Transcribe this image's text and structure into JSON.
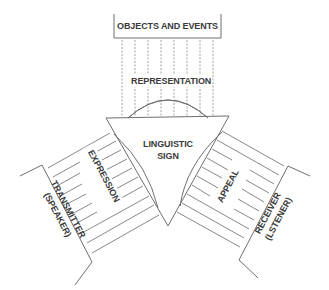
{
  "diagram": {
    "top_box": {
      "label": "OBJECTS AND EVENTS"
    },
    "top_channel": {
      "label": "REPRESENTATION"
    },
    "center": {
      "line1": "LINGUISTIC",
      "line2": "SIGN"
    },
    "left_channel": {
      "label": "EXPRESSION"
    },
    "left_box": {
      "line1": "TRANSMITTER",
      "line2": "(SPEAKER)"
    },
    "right_channel": {
      "label": "APPEAL"
    },
    "right_box": {
      "line1": "RECEIVER",
      "line2": "(LSTENER)"
    },
    "colors": {
      "line": "#6e6e6e",
      "text": "#3a3a3a",
      "background": "#ffffff"
    }
  }
}
